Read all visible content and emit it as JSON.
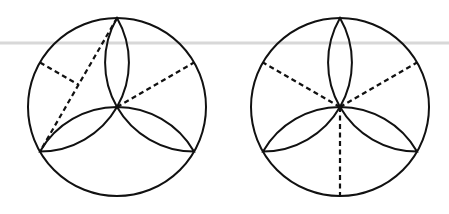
{
  "figure": {
    "colors": {
      "stroke": "#111111",
      "background": "#ffffff",
      "rule": "#d8d8d8"
    },
    "rule_line_y": 43,
    "panels": [
      {
        "id": "left",
        "center": [
          117,
          107
        ],
        "radius": 89,
        "petal_vertices": [
          [
            117,
            18
          ],
          [
            40,
            151.5
          ],
          [
            194,
            151.5
          ]
        ],
        "dashed_segments": [
          {
            "from": [
              40,
              62.5
            ],
            "to": [
              78.5,
              84.75
            ],
            "desc": "circle point at 150 deg to midpoint of chord"
          },
          {
            "from": [
              117,
              18
            ],
            "to": [
              40,
              151.5
            ],
            "desc": "chord from top vertex to lower-left vertex"
          },
          {
            "from": [
              117,
              107
            ],
            "to": [
              194,
              62.5
            ],
            "desc": "center to circle point at 30 deg"
          }
        ]
      },
      {
        "id": "right",
        "center": [
          340,
          107
        ],
        "radius": 89,
        "petal_vertices": [
          [
            340,
            18
          ],
          [
            263,
            151.5
          ],
          [
            417,
            151.5
          ]
        ],
        "dashed_segments": [
          {
            "from": [
              340,
              107
            ],
            "to": [
              263,
              62.5
            ],
            "desc": "center to circle point at 150 deg"
          },
          {
            "from": [
              340,
              107
            ],
            "to": [
              417,
              62.5
            ],
            "desc": "center to circle point at 30 deg"
          },
          {
            "from": [
              340,
              107
            ],
            "to": [
              340,
              196
            ],
            "desc": "center to circle point at 270 deg"
          }
        ]
      }
    ]
  }
}
